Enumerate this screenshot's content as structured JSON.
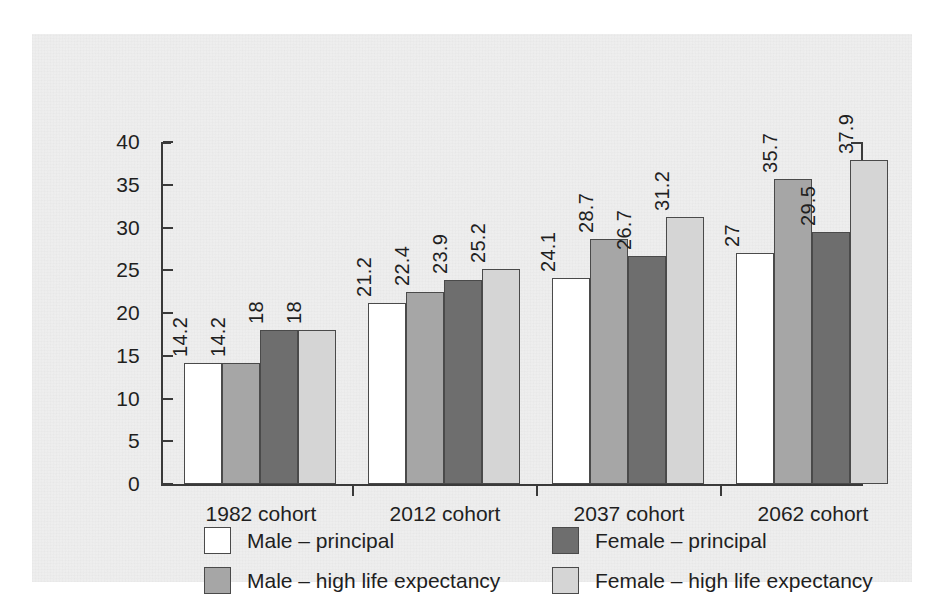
{
  "chart_data": {
    "type": "bar",
    "title": "",
    "subtitle": "",
    "xlabel": "",
    "ylabel": "",
    "categories": [
      "1982 cohort",
      "2012 cohort",
      "2037 cohort",
      "2062 cohort"
    ],
    "series": [
      {
        "name": "Male – principal",
        "color": "#ffffff",
        "values": [
          14.2,
          21.2,
          24.1,
          27
        ]
      },
      {
        "name": "Male – high life expectancy",
        "color": "#a6a6a6",
        "values": [
          14.2,
          22.4,
          28.7,
          35.7
        ]
      },
      {
        "name": "Female – principal",
        "color": "#6e6e6e",
        "values": [
          18,
          23.9,
          26.7,
          29.5
        ]
      },
      {
        "name": "Female – high life expectancy",
        "color": "#d5d5d5",
        "values": [
          18,
          25.2,
          31.2,
          37.9
        ]
      }
    ],
    "value_labels": [
      [
        "14.2",
        "14.2",
        "18",
        "18"
      ],
      [
        "21.2",
        "22.4",
        "23.9",
        "25.2"
      ],
      [
        "24.1",
        "28.7",
        "26.7",
        "31.2"
      ],
      [
        "27",
        "35.7",
        "29.5",
        "37.9"
      ]
    ],
    "ylim": [
      0,
      40
    ],
    "yticks": [
      0,
      5,
      10,
      15,
      20,
      25,
      30,
      35,
      40
    ],
    "ytick_labels": [
      "0",
      "5",
      "10",
      "15",
      "20",
      "25",
      "30",
      "35",
      "40"
    ],
    "grid": false,
    "legend_position": "bottom",
    "data_labels_rotated": true
  },
  "legend": {
    "entries": [
      {
        "label": "Male – principal",
        "swatch": "s0"
      },
      {
        "label": "Female – principal",
        "swatch": "s2"
      },
      {
        "label": "Male – high life expectancy",
        "swatch": "s1"
      },
      {
        "label": "Female – high life expectancy",
        "swatch": "s3"
      }
    ]
  },
  "colors": {
    "male_principal": "#ffffff",
    "male_high_life_expectancy": "#a6a6a6",
    "female_principal": "#6e6e6e",
    "female_high_life_expectancy": "#d5d5d5",
    "axis": "#3a3a3a",
    "paper": "#efefef"
  }
}
